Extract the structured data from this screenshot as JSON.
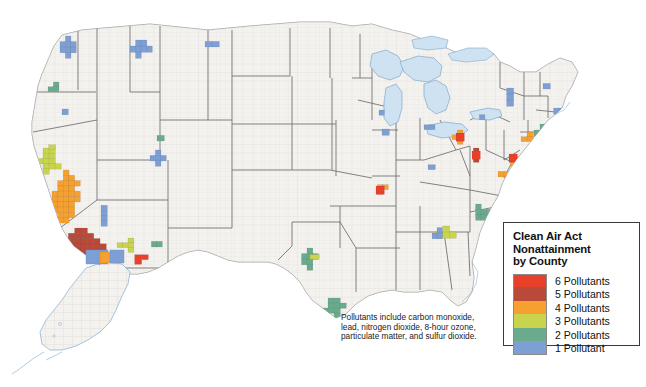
{
  "page": {
    "background_color": "#ffffff",
    "kind": "choropleth-map"
  },
  "map": {
    "name": "United States Clean Air Act Nonattainment by County",
    "land_color": "#f4f2ef",
    "county_line_color": "#cfcac4",
    "state_line_color": "#6d6d6d",
    "water_color": "#cfe2f2",
    "water_line_color": "#7fa8cc",
    "includes_alaska": true,
    "includes_hawaii": false
  },
  "legend": {
    "title": "Clean Air Act\nNonattainment\nby County",
    "items": [
      {
        "label": "6 Pollutants",
        "color": "#e8402a",
        "count": 6
      },
      {
        "label": "5 Pollutants",
        "color": "#b94a3a",
        "count": 5
      },
      {
        "label": "4 Pollutants",
        "color": "#f5a030",
        "count": 4
      },
      {
        "label": "3 Pollutants",
        "color": "#c8d44e",
        "count": 3
      },
      {
        "label": "2 Pollutants",
        "color": "#6aab8e",
        "count": 2
      },
      {
        "label": "1 Pollutant",
        "color": "#7d9fd4",
        "count": 1
      }
    ],
    "border_color": "#3a3a3a",
    "background_color": "#ffffff"
  },
  "caption": {
    "text": "Pollutants include carbon monoxide,\nlead, nitrogen dioxide, 8-hour ozone,\nparticulate matter, and sulfur dioxide."
  },
  "chart_data": {
    "type": "heatmap",
    "title": "Clean Air Act Nonattainment by County",
    "value_label": "Number of pollutants in nonattainment",
    "scale": [
      {
        "count": 6,
        "color": "#e8402a"
      },
      {
        "count": 5,
        "color": "#b94a3a"
      },
      {
        "count": 4,
        "color": "#f5a030"
      },
      {
        "count": 3,
        "color": "#c8d44e"
      },
      {
        "count": 2,
        "color": "#6aab8e"
      },
      {
        "count": 1,
        "color": "#7d9fd4"
      }
    ],
    "regions": [
      {
        "name": "Southern California (Los Angeles basin / Inland Empire)",
        "count": 5,
        "x": 62,
        "y": 228,
        "w": 44,
        "h": 42
      },
      {
        "name": "California Central Valley",
        "count": 4,
        "x": 52,
        "y": 170,
        "w": 28,
        "h": 58
      },
      {
        "name": "San Francisco Bay Area",
        "count": 3,
        "x": 37,
        "y": 148,
        "w": 24,
        "h": 26
      },
      {
        "name": "Sacramento Valley",
        "count": 3,
        "x": 42,
        "y": 140,
        "w": 20,
        "h": 14
      },
      {
        "name": "Northern California coast",
        "count": 2,
        "x": 33,
        "y": 160,
        "w": 12,
        "h": 14
      },
      {
        "name": "San Diego County",
        "count": 6,
        "x": 68,
        "y": 258,
        "w": 18,
        "h": 12
      },
      {
        "name": "Imperial / Yuma",
        "count": 4,
        "x": 86,
        "y": 259,
        "w": 16,
        "h": 10
      },
      {
        "name": "Phoenix, Arizona (Maricopa)",
        "count": 6,
        "x": 128,
        "y": 250,
        "w": 20,
        "h": 14
      },
      {
        "name": "Arizona surrounding counties",
        "count": 3,
        "x": 117,
        "y": 238,
        "w": 22,
        "h": 14
      },
      {
        "name": "Arizona eastern counties",
        "count": 2,
        "x": 146,
        "y": 236,
        "w": 16,
        "h": 16
      },
      {
        "name": "Nevada / Las Vegas",
        "count": 1,
        "x": 95,
        "y": 200,
        "w": 18,
        "h": 26
      },
      {
        "name": "Seattle / Puget Sound",
        "count": 1,
        "x": 60,
        "y": 36,
        "w": 16,
        "h": 22
      },
      {
        "name": "Portland, Oregon",
        "count": 2,
        "x": 48,
        "y": 82,
        "w": 16,
        "h": 14
      },
      {
        "name": "Oregon inland",
        "count": 1,
        "x": 62,
        "y": 98,
        "w": 12,
        "h": 22
      },
      {
        "name": "Northern Idaho / Montana",
        "count": 1,
        "x": 130,
        "y": 40,
        "w": 22,
        "h": 18
      },
      {
        "name": "Idaho / Utah border",
        "count": 2,
        "x": 150,
        "y": 130,
        "w": 14,
        "h": 16
      },
      {
        "name": "Salt Lake City, Utah",
        "count": 1,
        "x": 150,
        "y": 150,
        "w": 16,
        "h": 16
      },
      {
        "name": "Denver, Colorado",
        "count": 1,
        "x": 196,
        "y": 165,
        "w": 14,
        "h": 12
      },
      {
        "name": "Great Falls / Montana east",
        "count": 1,
        "x": 205,
        "y": 36,
        "w": 14,
        "h": 16
      },
      {
        "name": "Wyoming / Dakotas",
        "count": 1,
        "x": 224,
        "y": 58,
        "w": 12,
        "h": 12
      },
      {
        "name": "Albuquerque / New Mexico",
        "count": 1,
        "x": 170,
        "y": 232,
        "w": 10,
        "h": 10
      },
      {
        "name": "El Paso, Texas",
        "count": 1,
        "x": 168,
        "y": 258,
        "w": 10,
        "h": 10
      },
      {
        "name": "Dallas–Fort Worth, Texas",
        "count": 2,
        "x": 296,
        "y": 248,
        "w": 22,
        "h": 22
      },
      {
        "name": "Dallas northern counties",
        "count": 1,
        "x": 298,
        "y": 250,
        "w": 12,
        "h": 9
      },
      {
        "name": "Dallas east county",
        "count": 3,
        "x": 310,
        "y": 250,
        "w": 9,
        "h": 9
      },
      {
        "name": "Houston, Texas",
        "count": 2,
        "x": 322,
        "y": 298,
        "w": 24,
        "h": 20
      },
      {
        "name": "Chicago, Illinois",
        "count": 1,
        "x": 382,
        "y": 123,
        "w": 14,
        "h": 18
      },
      {
        "name": "Chicago / NW Indiana core",
        "count": 3,
        "x": 388,
        "y": 136,
        "w": 12,
        "h": 10
      },
      {
        "name": "St. Louis, Missouri",
        "count": 4,
        "x": 372,
        "y": 180,
        "w": 16,
        "h": 14
      },
      {
        "name": "St. Louis core",
        "count": 6,
        "x": 376,
        "y": 186,
        "w": 8,
        "h": 8
      },
      {
        "name": "St. Louis outlying",
        "count": 3,
        "x": 366,
        "y": 178,
        "w": 10,
        "h": 10
      },
      {
        "name": "Milwaukee / Wisconsin lakeshore",
        "count": 1,
        "x": 374,
        "y": 100,
        "w": 10,
        "h": 20
      },
      {
        "name": "Detroit, Michigan",
        "count": 1,
        "x": 424,
        "y": 120,
        "w": 16,
        "h": 14
      },
      {
        "name": "Cleveland, Ohio",
        "count": 4,
        "x": 452,
        "y": 130,
        "w": 16,
        "h": 14
      },
      {
        "name": "Cleveland core",
        "count": 6,
        "x": 456,
        "y": 133,
        "w": 8,
        "h": 8
      },
      {
        "name": "Ohio Valley / Cincinnati",
        "count": 1,
        "x": 428,
        "y": 160,
        "w": 14,
        "h": 14
      },
      {
        "name": "Indianapolis, Indiana",
        "count": 1,
        "x": 404,
        "y": 158,
        "w": 10,
        "h": 10
      },
      {
        "name": "Louisville, Kentucky",
        "count": 2,
        "x": 414,
        "y": 180,
        "w": 12,
        "h": 10
      },
      {
        "name": "Knoxville / Tennessee",
        "count": 2,
        "x": 440,
        "y": 200,
        "w": 14,
        "h": 12
      },
      {
        "name": "Birmingham, Alabama",
        "count": 2,
        "x": 406,
        "y": 228,
        "w": 12,
        "h": 12
      },
      {
        "name": "Atlanta, Georgia",
        "count": 3,
        "x": 436,
        "y": 226,
        "w": 20,
        "h": 18
      },
      {
        "name": "Atlanta outer counties",
        "count": 1,
        "x": 432,
        "y": 222,
        "w": 10,
        "h": 22
      },
      {
        "name": "Charlotte / western North Carolina",
        "count": 2,
        "x": 470,
        "y": 204,
        "w": 22,
        "h": 16
      },
      {
        "name": "Tennessee / NC mountains",
        "count": 3,
        "x": 446,
        "y": 200,
        "w": 12,
        "h": 10
      },
      {
        "name": "Pittsburgh, Pennsylvania",
        "count": 5,
        "x": 468,
        "y": 148,
        "w": 16,
        "h": 14
      },
      {
        "name": "Pittsburgh core",
        "count": 6,
        "x": 472,
        "y": 151,
        "w": 8,
        "h": 8
      },
      {
        "name": "Washington DC / Baltimore",
        "count": 4,
        "x": 492,
        "y": 166,
        "w": 18,
        "h": 16
      },
      {
        "name": "Baltimore core",
        "count": 5,
        "x": 498,
        "y": 167,
        "w": 9,
        "h": 9
      },
      {
        "name": "Philadelphia, Pennsylvania",
        "count": 4,
        "x": 505,
        "y": 152,
        "w": 16,
        "h": 14
      },
      {
        "name": "Philadelphia core",
        "count": 6,
        "x": 509,
        "y": 154,
        "w": 8,
        "h": 8
      },
      {
        "name": "New Jersey corridor",
        "count": 3,
        "x": 505,
        "y": 160,
        "w": 14,
        "h": 18
      },
      {
        "name": "New York City metro",
        "count": 4,
        "x": 521,
        "y": 132,
        "w": 18,
        "h": 14
      },
      {
        "name": "New York / Connecticut",
        "count": 2,
        "x": 528,
        "y": 124,
        "w": 24,
        "h": 12
      },
      {
        "name": "Long Island",
        "count": 2,
        "x": 536,
        "y": 138,
        "w": 22,
        "h": 8
      },
      {
        "name": "Boston, Massachusetts",
        "count": 1,
        "x": 548,
        "y": 108,
        "w": 22,
        "h": 12
      },
      {
        "name": "Upstate New York",
        "count": 1,
        "x": 500,
        "y": 88,
        "w": 20,
        "h": 18
      },
      {
        "name": "Vermont / New Hampshire",
        "count": 1,
        "x": 536,
        "y": 78,
        "w": 14,
        "h": 16
      },
      {
        "name": "Western New York / Buffalo",
        "count": 1,
        "x": 474,
        "y": 110,
        "w": 16,
        "h": 14
      },
      {
        "name": "Maine coast",
        "count": 1,
        "x": 562,
        "y": 68,
        "w": 12,
        "h": 12
      },
      {
        "name": "Richmond / Virginia",
        "count": 1,
        "x": 496,
        "y": 186,
        "w": 14,
        "h": 10
      },
      {
        "name": "Norfolk / Virginia Beach",
        "count": 1,
        "x": 504,
        "y": 192,
        "w": 10,
        "h": 8
      },
      {
        "name": "Tampa / Florida",
        "count": 1,
        "x": 468,
        "y": 292,
        "w": 10,
        "h": 10
      },
      {
        "name": "Jacksonville / north Florida",
        "count": 2,
        "x": 474,
        "y": 258,
        "w": 12,
        "h": 14
      },
      {
        "name": "Baton Rouge, Louisiana",
        "count": 1,
        "x": 368,
        "y": 284,
        "w": 12,
        "h": 10
      },
      {
        "name": "Memphis, Tennessee",
        "count": 1,
        "x": 378,
        "y": 214,
        "w": 10,
        "h": 10
      },
      {
        "name": "Kansas City",
        "count": 1,
        "x": 318,
        "y": 170,
        "w": 10,
        "h": 9
      },
      {
        "name": "Iowa / Cedar Rapids",
        "count": 1,
        "x": 340,
        "y": 132,
        "w": 10,
        "h": 9
      },
      {
        "name": "Minnesota / Twin Cities",
        "count": 1,
        "x": 330,
        "y": 86,
        "w": 12,
        "h": 12
      }
    ]
  }
}
